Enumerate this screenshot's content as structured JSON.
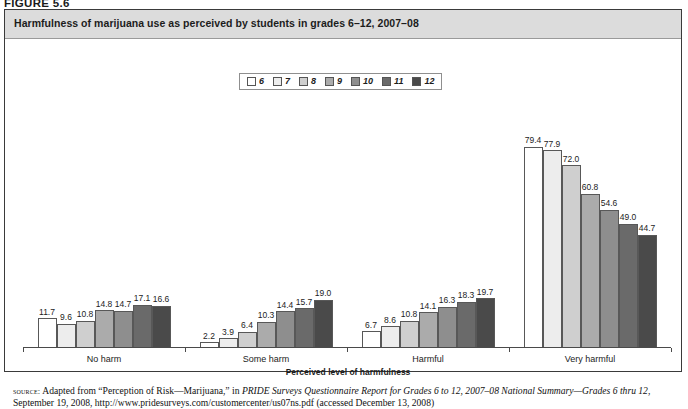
{
  "figure": {
    "number": "FIGURE 5.6"
  },
  "title": "Harmfulness of marijuana use as perceived by students in grades 6–12, 2007–08",
  "legend": {
    "items": [
      {
        "label": "6",
        "color": "#ffffff"
      },
      {
        "label": "7",
        "color": "#ededed"
      },
      {
        "label": "8",
        "color": "#cfcfcf"
      },
      {
        "label": "9",
        "color": "#ababab"
      },
      {
        "label": "10",
        "color": "#8e8e8e"
      },
      {
        "label": "11",
        "color": "#6a6a6a"
      },
      {
        "label": "12",
        "color": "#4a4a4a"
      }
    ]
  },
  "chart_data": {
    "type": "bar",
    "title": "Harmfulness of marijuana use as perceived by students in grades 6–12, 2007–08",
    "xlabel": "Perceived level of harmfulness",
    "ylabel": "",
    "ylim": [
      0,
      100
    ],
    "grid": false,
    "legend_position": "top-center",
    "categories": [
      "No harm",
      "Some harm",
      "Harmful",
      "Very harmful"
    ],
    "series": [
      {
        "name": "6",
        "values": [
          11.7,
          2.2,
          6.7,
          79.4
        ]
      },
      {
        "name": "7",
        "values": [
          9.6,
          3.9,
          8.6,
          77.9
        ]
      },
      {
        "name": "8",
        "values": [
          10.8,
          6.4,
          10.8,
          72.0
        ]
      },
      {
        "name": "9",
        "values": [
          14.8,
          10.3,
          14.1,
          60.8
        ]
      },
      {
        "name": "10",
        "values": [
          14.7,
          14.4,
          16.3,
          54.6
        ]
      },
      {
        "name": "11",
        "values": [
          17.1,
          15.7,
          18.3,
          49.0
        ]
      },
      {
        "name": "12",
        "values": [
          16.6,
          19.0,
          19.7,
          44.7
        ]
      }
    ]
  },
  "axis": {
    "x_title": "Perceived level of harmfulness"
  },
  "source": {
    "label": "source:",
    "line1_a": " Adapted from “Perception of Risk—Marijuana,” in ",
    "line1_italic": "PRIDE Surveys Questionnaire Report for Grades 6 to 12, 2007–08 National Summary—",
    "line2_italic": "Grades 6 thru 12",
    "line2_b": ", September 19, 2008, http://www.pridesurveys.com/customercenter/us07ns.pdf (accessed December 13, 2008)"
  }
}
